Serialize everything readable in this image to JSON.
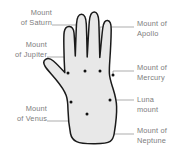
{
  "diagram": {
    "hand_fill": "#e8e8e8",
    "hand_stroke": "#1a1a1a",
    "leader_color": "#8a8a8a",
    "dot_color": "#111111",
    "label_color": "#7d7d7d",
    "background": "#ffffff"
  },
  "labels": {
    "saturn": {
      "line1": "Mount",
      "line2": "of Saturn"
    },
    "jupiter": {
      "line1": "Mount",
      "line2": "of Jupiter"
    },
    "venus": {
      "line1": "Mount",
      "line2": "of Venus"
    },
    "apollo": {
      "line1": "Mount of",
      "line2": "Apollo"
    },
    "mercury": {
      "line1": "Mount of",
      "line2": "Mercury"
    },
    "luna": {
      "line1": "Luna",
      "line2": "mount"
    },
    "neptune": {
      "line1": "Mount of",
      "line2": "Neptune"
    }
  },
  "mount_points": [
    {
      "name": "jupiter",
      "x": 68,
      "y": 73
    },
    {
      "name": "saturn",
      "x": 85,
      "y": 71
    },
    {
      "name": "apollo",
      "x": 100,
      "y": 71
    },
    {
      "name": "mercury",
      "x": 113,
      "y": 75
    },
    {
      "name": "venus",
      "x": 71,
      "y": 102
    },
    {
      "name": "luna",
      "x": 110,
      "y": 100
    },
    {
      "name": "neptune",
      "x": 87,
      "y": 114
    }
  ]
}
